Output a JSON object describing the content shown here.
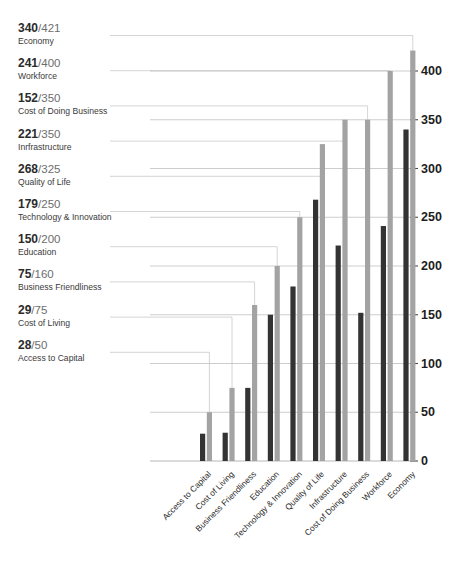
{
  "chart_data": {
    "type": "bar",
    "title": "",
    "subtitle": "",
    "xlabel": "",
    "ylabel": "",
    "ylim": [
      0,
      421
    ],
    "y_axis_max_tick": 400,
    "y_ticks": [
      0,
      50,
      100,
      150,
      200,
      250,
      300,
      350,
      400
    ],
    "grid": true,
    "legend_position": "left",
    "orientation": "vertical",
    "categories": [
      "Access to Capital",
      "Cost of Living",
      "Business Friendliness",
      "Education",
      "Technology & Innovation",
      "Quality of Life",
      "Infrastructure",
      "Cost of Doing Business",
      "Workforce",
      "Economy"
    ],
    "series": [
      {
        "name": "Score",
        "color": "#333333",
        "values": [
          28,
          29,
          75,
          150,
          179,
          268,
          221,
          152,
          241,
          340
        ]
      },
      {
        "name": "Total",
        "color": "#a3a3a3",
        "values": [
          50,
          75,
          160,
          200,
          250,
          325,
          350,
          350,
          400,
          421
        ]
      }
    ]
  },
  "legend": {
    "items": [
      {
        "score": "340",
        "sep": "/",
        "total": "421",
        "label": "Economy"
      },
      {
        "score": "241",
        "sep": "/",
        "total": "400",
        "label": "Workforce"
      },
      {
        "score": "152",
        "sep": "/",
        "total": "350",
        "label": "Cost of Doing Business"
      },
      {
        "score": "221",
        "sep": "/",
        "total": "350",
        "label": "Inrfrastructure"
      },
      {
        "score": "268",
        "sep": "/",
        "total": "325",
        "label": "Quality of Life"
      },
      {
        "score": "179",
        "sep": "/",
        "total": "250",
        "label": "Technology & Innovation"
      },
      {
        "score": "150",
        "sep": "/",
        "total": "200",
        "label": "Education"
      },
      {
        "score": "75",
        "sep": "/",
        "total": "160",
        "label": "Business Friendliness"
      },
      {
        "score": "29",
        "sep": "/",
        "total": "75",
        "label": "Cost of Living"
      },
      {
        "score": "28",
        "sep": "/",
        "total": "50",
        "label": "Access to Capital"
      }
    ]
  },
  "axis": {
    "y_tick_labels": [
      "400",
      "350",
      "300",
      "250",
      "200",
      "150",
      "100",
      "50",
      "0"
    ],
    "x_tick_labels": [
      "Access to Capital",
      "Cost of Living",
      "Business Friendliness",
      "Education",
      "Technology & Innovation",
      "Quality of Life",
      "Infrastructure",
      "Cost of Doing Business",
      "Workforce",
      "Economy"
    ]
  },
  "colors": {
    "bar_dark": "#333333",
    "bar_light": "#a3a3a3",
    "grid": "#b8b8b8",
    "leader": "#c9c9c9",
    "text": "#2b2b2b",
    "muted_text": "#6d6d6d",
    "background": "#ffffff"
  }
}
